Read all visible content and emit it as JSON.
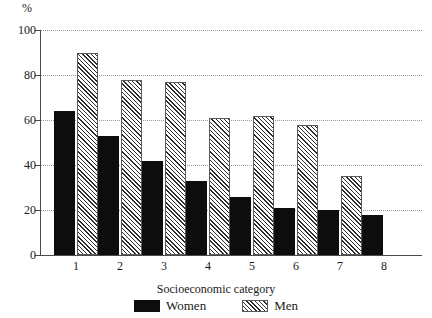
{
  "chart_data": {
    "type": "bar",
    "title": "",
    "xlabel": "Socioeconomic category",
    "ylabel": "%",
    "categories": [
      "1",
      "2",
      "3",
      "4",
      "5",
      "6",
      "7",
      "8"
    ],
    "series": [
      {
        "name": "Women",
        "values": [
          64,
          53,
          42,
          33,
          26,
          21,
          20,
          18
        ]
      },
      {
        "name": "Men",
        "values": [
          90,
          78,
          77,
          61,
          62,
          58,
          35,
          null
        ]
      }
    ],
    "ylim": [
      0,
      100
    ],
    "yticks": [
      0,
      20,
      40,
      60,
      80,
      100
    ],
    "ytick_labels": [
      "0",
      "20",
      "40",
      "60",
      "80",
      "100"
    ],
    "grid": true,
    "grid_axis": "y",
    "legend_position": "bottom",
    "colors": {
      "women": "#0d0d0d",
      "men_hatch": "#2e2e2e",
      "men_background": "#f2f2f2",
      "axis": "#4a4a4a",
      "gridline": "#9a9a9a"
    }
  },
  "axes": {
    "unit_label": "%",
    "x_axis_title": "Socioeconomic category"
  },
  "legend": {
    "items": [
      {
        "label": "Women",
        "swatch": "solid-black-swatch"
      },
      {
        "label": "Men",
        "swatch": "hatched-swatch"
      }
    ]
  }
}
